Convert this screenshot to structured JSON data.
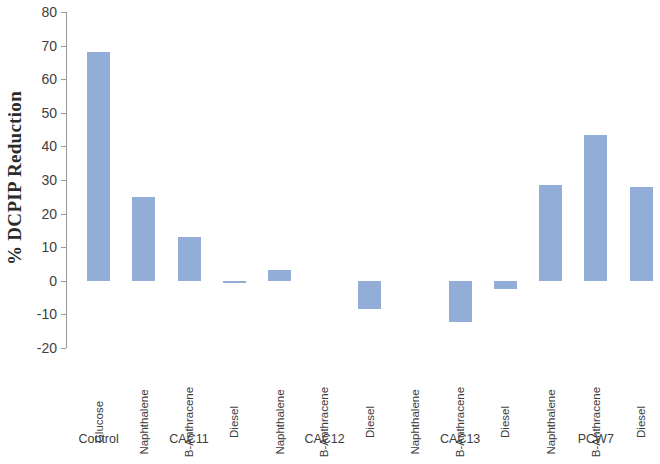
{
  "chart_data": {
    "type": "bar",
    "title": "",
    "xlabel": "",
    "ylabel": "% DCPIP Reduction",
    "ylim": [
      -20,
      80
    ],
    "ytick_step": 10,
    "ytick_labels": [
      "80",
      "70",
      "60",
      "50",
      "40",
      "30",
      "20",
      "10",
      "0",
      "-10",
      "-20"
    ],
    "ytick_values": [
      80,
      70,
      60,
      50,
      40,
      30,
      20,
      10,
      0,
      -10,
      -20
    ],
    "grid": false,
    "legend": null,
    "bar_color": "#93ADD9",
    "axis_color": "#9a9a9a",
    "categories": [
      "Glucose",
      "Naphthalene",
      "B-Anthracene",
      "Diesel",
      "Naphthalene",
      "B-Anthracene",
      "Diesel",
      "Naphthalene",
      "B-Anthracene",
      "Diesel",
      "Naphthalene",
      "B-Anthracene",
      "Diesel"
    ],
    "values": [
      68,
      25,
      13,
      -0.5,
      3.3,
      0,
      -8.5,
      0,
      -12.3,
      -2.3,
      28.5,
      43.5,
      28
    ],
    "groups": [
      {
        "label": "Control",
        "categories": [
          "Glucose"
        ]
      },
      {
        "label": "CAC11",
        "categories": [
          "Naphthalene",
          "B-Anthracene",
          "Diesel"
        ]
      },
      {
        "label": "CAC12",
        "categories": [
          "Naphthalene",
          "B-Anthracene",
          "Diesel"
        ]
      },
      {
        "label": "CAC13",
        "categories": [
          "Naphthalene",
          "B-Anthracene",
          "Diesel"
        ]
      },
      {
        "label": "PCW7",
        "categories": [
          "Naphthalene",
          "B-Anthracene",
          "Diesel"
        ]
      }
    ],
    "group_labels": [
      "Control",
      "CAC11",
      "CAC12",
      "CAC13",
      "PCW7"
    ]
  }
}
